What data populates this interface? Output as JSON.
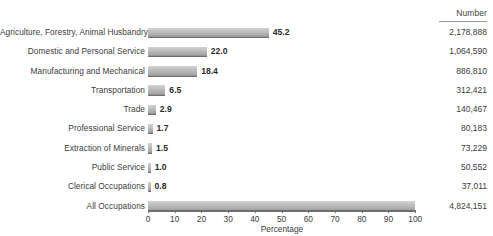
{
  "table": {
    "number_header": "Number"
  },
  "axis": {
    "title": "Percentage",
    "ticks": [
      "0",
      "10",
      "20",
      "30",
      "40",
      "50",
      "60",
      "70",
      "80",
      "90",
      "100"
    ]
  },
  "chart_data": {
    "type": "bar",
    "orientation": "horizontal",
    "title": "",
    "xlabel": "Percentage",
    "ylabel": "",
    "xlim": [
      0,
      100
    ],
    "grid": false,
    "legend": false,
    "value_labels": true,
    "categories": [
      "Agriculture, Forestry, Animal Husbandry",
      "Domestic and Personal Service",
      "Manufacturing and Mechanical",
      "Transportation",
      "Trade",
      "Professional Service",
      "Extraction of Minerals",
      "Public Service",
      "Clerical Occupations",
      "All Occupations"
    ],
    "values": [
      45.2,
      22.0,
      18.4,
      6.5,
      2.9,
      1.7,
      1.5,
      1.0,
      0.8,
      100.0
    ],
    "value_label_text": [
      "45.2",
      "22.0",
      "18.4",
      "6.5",
      "2.9",
      "1.7",
      "1.5",
      "1.0",
      "0.8",
      ""
    ],
    "numbers": [
      "2,178,888",
      "1,064,590",
      "886,810",
      "312,421",
      "140,467",
      "80,183",
      "73,229",
      "50,552",
      "37,011",
      "4,824,151"
    ],
    "number_column_header": "Number"
  },
  "colors": {
    "bar_top": "#d3d3d3",
    "bar_bottom": "#8f8f8f",
    "bar_edge": "#6f6f6f",
    "text": "#3b3b3b",
    "background": "#ffffff"
  }
}
